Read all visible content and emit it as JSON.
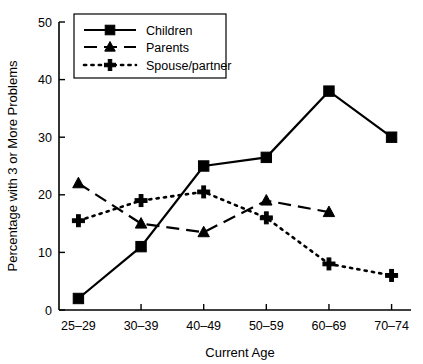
{
  "chart_data": {
    "type": "line",
    "title": "",
    "xlabel": "Current Age",
    "ylabel": "Percentage with 3 or More Problems",
    "categories": [
      "25–29",
      "30–39",
      "40–49",
      "50–59",
      "60–69",
      "70–74"
    ],
    "ylim": [
      0,
      50
    ],
    "yticks": [
      0,
      10,
      20,
      30,
      40,
      50
    ],
    "ytick_labels": [
      "0",
      "10",
      "20",
      "30",
      "40",
      "50"
    ],
    "grid": false,
    "legend_position": "top-left",
    "series": [
      {
        "name": "Children",
        "marker": "square",
        "linestyle": "solid",
        "color": "#000000",
        "values": [
          2,
          11,
          25,
          26.5,
          38,
          30
        ]
      },
      {
        "name": "Parents",
        "marker": "triangle",
        "linestyle": "dashed",
        "color": "#000000",
        "values": [
          22,
          15,
          13.5,
          19,
          17,
          null
        ]
      },
      {
        "name": "Spouse/partner",
        "marker": "plus",
        "linestyle": "dotted",
        "color": "#000000",
        "values": [
          15.5,
          19,
          20.5,
          16,
          8,
          6
        ]
      }
    ]
  },
  "legend": {
    "items": [
      {
        "label": "Children"
      },
      {
        "label": "Parents"
      },
      {
        "label": "Spouse/partner"
      }
    ]
  },
  "axes": {
    "x_title": "Current Age",
    "y_title": "Percentage with 3 or More Problems"
  }
}
